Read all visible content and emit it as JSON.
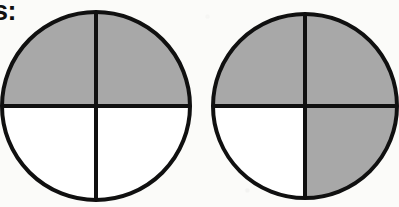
{
  "page": {
    "background_color": "#fbfbf9",
    "width": 399,
    "height": 207,
    "clipped_heading_text": "s:"
  },
  "style": {
    "shaded_color": "#a8a8a8",
    "unshaded_color": "#ffffff",
    "stroke_color": "#101010",
    "stroke_width": 4
  },
  "chart_data": {
    "type": "pie",
    "title": "",
    "subtitle": "",
    "xlabel": "",
    "ylabel": "",
    "grid": false,
    "legend_position": "none",
    "annotations": [
      "s:"
    ],
    "charts": [
      {
        "name": "circle-1",
        "total_parts": 4,
        "shaded_parts": 2,
        "fraction": "2/4",
        "value": 0.5,
        "center_x": 96,
        "center_y": 106,
        "diameter": 188,
        "slices": [
          {
            "label": "top-left",
            "start_deg": 180,
            "end_deg": 270,
            "shaded": false,
            "color": "#ffffff"
          },
          {
            "label": "top-right",
            "start_deg": 270,
            "end_deg": 360,
            "shaded": true,
            "color": "#a8a8a8"
          },
          {
            "label": "bottom-right",
            "start_deg": 0,
            "end_deg": 90,
            "shaded": true,
            "color": "#a8a8a8"
          },
          {
            "label": "bottom-left",
            "start_deg": 90,
            "end_deg": 180,
            "shaded": false,
            "color": "#ffffff"
          }
        ]
      },
      {
        "name": "circle-2",
        "total_parts": 4,
        "shaded_parts": 3,
        "fraction": "3/4",
        "value": 0.75,
        "center_x": 305,
        "center_y": 106,
        "diameter": 184,
        "slices": [
          {
            "label": "top-left",
            "start_deg": 180,
            "end_deg": 270,
            "shaded": false,
            "color": "#ffffff"
          },
          {
            "label": "top-right",
            "start_deg": 270,
            "end_deg": 360,
            "shaded": true,
            "color": "#a8a8a8"
          },
          {
            "label": "bottom-right",
            "start_deg": 0,
            "end_deg": 90,
            "shaded": true,
            "color": "#a8a8a8"
          },
          {
            "label": "bottom-left",
            "start_deg": 90,
            "end_deg": 180,
            "shaded": true,
            "color": "#a8a8a8"
          }
        ]
      }
    ]
  }
}
